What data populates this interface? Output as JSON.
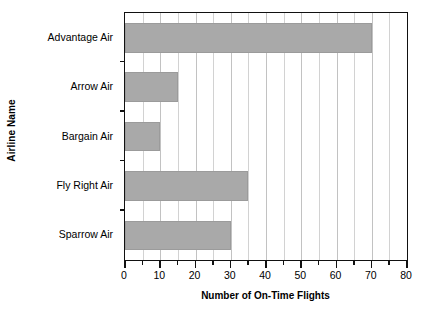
{
  "chart_data": {
    "type": "bar",
    "orientation": "horizontal",
    "title": "",
    "xlabel": "Number of On-Time Flights",
    "ylabel": "Airline Name",
    "categories": [
      "Advantage Air",
      "Arrow Air",
      "Bargain Air",
      "Fly Right Air",
      "Sparrow Air"
    ],
    "values": [
      70,
      15,
      10,
      35,
      30
    ],
    "xlim": [
      0,
      80
    ],
    "xticks": [
      0,
      10,
      20,
      30,
      40,
      50,
      60,
      70,
      80
    ],
    "xtick_labels": [
      "0",
      "10",
      "20",
      "30",
      "40",
      "50",
      "60",
      "70",
      "80"
    ],
    "minor_tick_step": 5,
    "grid": true,
    "grid_axis": "x",
    "legend": false,
    "bar_color": "#a9a9a9",
    "grid_color": "#d2d2d2",
    "axis_color": "#111111",
    "background_color": "#ffffff"
  }
}
